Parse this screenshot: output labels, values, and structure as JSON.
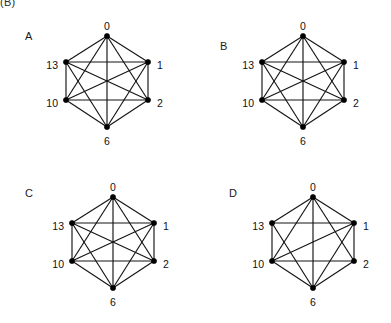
{
  "figure": {
    "caption_fragment": "(B)",
    "background_color": "#ffffff",
    "ink_color": "#141414",
    "node_color": "#000000",
    "width": 391,
    "height": 323
  },
  "vertex_labels": {
    "top": "0",
    "upper_right": "1",
    "lower_right": "2",
    "bottom": "6",
    "lower_left": "10",
    "upper_left": "13"
  },
  "panels": [
    {
      "letter": "A",
      "letter_x": 25,
      "letter_y": 31,
      "origin_x": 0,
      "origin_y": 0,
      "center_x": 107,
      "center_y": 81,
      "radius_x": 41,
      "radius_y": 45,
      "nodes": [
        {
          "id": "0",
          "x": 107,
          "y": 36,
          "label": "0",
          "label_x": 107,
          "label_y": 27,
          "anchor": "middle"
        },
        {
          "id": "1",
          "x": 148,
          "y": 62,
          "label": "1",
          "label_x": 157,
          "label_y": 66,
          "anchor": "start"
        },
        {
          "id": "2",
          "x": 148,
          "y": 100,
          "label": "2",
          "label_x": 157,
          "label_y": 104,
          "anchor": "start"
        },
        {
          "id": "6",
          "x": 107,
          "y": 127,
          "label": "6",
          "label_x": 107,
          "label_y": 142,
          "anchor": "middle"
        },
        {
          "id": "10",
          "x": 66,
          "y": 100,
          "label": "10",
          "label_x": 58,
          "label_y": 104,
          "anchor": "end"
        },
        {
          "id": "13",
          "x": 66,
          "y": 62,
          "label": "13",
          "label_x": 58,
          "label_y": 66,
          "anchor": "end"
        }
      ],
      "edges": [
        [
          "0",
          "1"
        ],
        [
          "0",
          "2"
        ],
        [
          "0",
          "6"
        ],
        [
          "0",
          "10"
        ],
        [
          "0",
          "13"
        ],
        [
          "1",
          "2"
        ],
        [
          "1",
          "6"
        ],
        [
          "1",
          "10"
        ],
        [
          "1",
          "13"
        ],
        [
          "2",
          "6"
        ],
        [
          "2",
          "10"
        ],
        [
          "2",
          "13"
        ],
        [
          "6",
          "10"
        ],
        [
          "6",
          "13"
        ],
        [
          "10",
          "13"
        ]
      ],
      "edge_count": 15
    },
    {
      "letter": "B",
      "letter_x": 220,
      "letter_y": 41,
      "origin_x": 196,
      "origin_y": 0,
      "center_x": 107,
      "center_y": 81,
      "radius_x": 41,
      "radius_y": 45,
      "nodes": [
        {
          "id": "0",
          "x": 107,
          "y": 36,
          "label": "0",
          "label_x": 107,
          "label_y": 27,
          "anchor": "middle"
        },
        {
          "id": "1",
          "x": 148,
          "y": 62,
          "label": "1",
          "label_x": 157,
          "label_y": 66,
          "anchor": "start"
        },
        {
          "id": "2",
          "x": 148,
          "y": 100,
          "label": "2",
          "label_x": 157,
          "label_y": 104,
          "anchor": "start"
        },
        {
          "id": "6",
          "x": 107,
          "y": 127,
          "label": "6",
          "label_x": 107,
          "label_y": 142,
          "anchor": "middle"
        },
        {
          "id": "10",
          "x": 66,
          "y": 100,
          "label": "10",
          "label_x": 58,
          "label_y": 104,
          "anchor": "end"
        },
        {
          "id": "13",
          "x": 66,
          "y": 62,
          "label": "13",
          "label_x": 58,
          "label_y": 66,
          "anchor": "end"
        }
      ],
      "edges": [
        [
          "0",
          "1"
        ],
        [
          "0",
          "2"
        ],
        [
          "0",
          "6"
        ],
        [
          "0",
          "10"
        ],
        [
          "0",
          "13"
        ],
        [
          "1",
          "2"
        ],
        [
          "1",
          "6"
        ],
        [
          "1",
          "10"
        ],
        [
          "1",
          "13"
        ],
        [
          "2",
          "6"
        ],
        [
          "2",
          "10"
        ],
        [
          "2",
          "13"
        ],
        [
          "6",
          "10"
        ],
        [
          "6",
          "13"
        ],
        [
          "10",
          "13"
        ]
      ],
      "edge_count": 15
    },
    {
      "letter": "C",
      "letter_x": 25,
      "letter_y": 188,
      "origin_x": 0,
      "origin_y": 161,
      "center_x": 113,
      "center_y": 81,
      "radius_x": 41,
      "radius_y": 45,
      "nodes": [
        {
          "id": "0",
          "x": 113,
          "y": 36,
          "label": "0",
          "label_x": 113,
          "label_y": 27,
          "anchor": "middle"
        },
        {
          "id": "1",
          "x": 154,
          "y": 62,
          "label": "1",
          "label_x": 163,
          "label_y": 66,
          "anchor": "start"
        },
        {
          "id": "2",
          "x": 154,
          "y": 100,
          "label": "2",
          "label_x": 163,
          "label_y": 104,
          "anchor": "start"
        },
        {
          "id": "6",
          "x": 113,
          "y": 127,
          "label": "6",
          "label_x": 113,
          "label_y": 142,
          "anchor": "middle"
        },
        {
          "id": "10",
          "x": 72,
          "y": 100,
          "label": "10",
          "label_x": 64,
          "label_y": 104,
          "anchor": "end"
        },
        {
          "id": "13",
          "x": 72,
          "y": 62,
          "label": "13",
          "label_x": 64,
          "label_y": 66,
          "anchor": "end"
        }
      ],
      "edges": [
        [
          "0",
          "1"
        ],
        [
          "0",
          "2"
        ],
        [
          "0",
          "6"
        ],
        [
          "0",
          "10"
        ],
        [
          "0",
          "13"
        ],
        [
          "1",
          "2"
        ],
        [
          "1",
          "6"
        ],
        [
          "1",
          "10"
        ],
        [
          "1",
          "13"
        ],
        [
          "2",
          "6"
        ],
        [
          "2",
          "10"
        ],
        [
          "2",
          "13"
        ],
        [
          "6",
          "10"
        ],
        [
          "6",
          "13"
        ],
        [
          "10",
          "13"
        ]
      ],
      "edge_count": 15
    },
    {
      "letter": "D",
      "letter_x": 229,
      "letter_y": 188,
      "origin_x": 196,
      "origin_y": 161,
      "center_x": 117,
      "center_y": 81,
      "radius_x": 41,
      "radius_y": 45,
      "nodes": [
        {
          "id": "0",
          "x": 117,
          "y": 36,
          "label": "0",
          "label_x": 117,
          "label_y": 27,
          "anchor": "middle"
        },
        {
          "id": "1",
          "x": 158,
          "y": 62,
          "label": "1",
          "label_x": 167,
          "label_y": 66,
          "anchor": "start"
        },
        {
          "id": "2",
          "x": 158,
          "y": 100,
          "label": "2",
          "label_x": 167,
          "label_y": 104,
          "anchor": "start"
        },
        {
          "id": "6",
          "x": 117,
          "y": 127,
          "label": "6",
          "label_x": 117,
          "label_y": 142,
          "anchor": "middle"
        },
        {
          "id": "10",
          "x": 76,
          "y": 100,
          "label": "10",
          "label_x": 68,
          "label_y": 104,
          "anchor": "end"
        },
        {
          "id": "13",
          "x": 76,
          "y": 62,
          "label": "13",
          "label_x": 68,
          "label_y": 66,
          "anchor": "end"
        }
      ],
      "edges": [
        [
          "0",
          "1"
        ],
        [
          "0",
          "2"
        ],
        [
          "0",
          "6"
        ],
        [
          "0",
          "10"
        ],
        [
          "0",
          "13"
        ],
        [
          "1",
          "2"
        ],
        [
          "1",
          "6"
        ],
        [
          "1",
          "10"
        ],
        [
          "1",
          "13"
        ],
        [
          "2",
          "6"
        ],
        [
          "2",
          "10"
        ],
        [
          "6",
          "10"
        ],
        [
          "6",
          "13"
        ],
        [
          "10",
          "13"
        ]
      ],
      "edge_count": 14
    }
  ]
}
